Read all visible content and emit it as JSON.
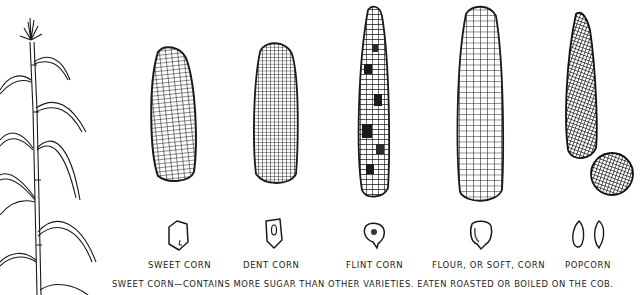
{
  "figure": {
    "stalk": {
      "name": "corn-stalk"
    },
    "varieties": [
      {
        "id": "sweet",
        "label": "Sweet Corn",
        "ear_style": "rows-spiral",
        "kernel": "flat-seed"
      },
      {
        "id": "dent",
        "label": "Dent Corn",
        "ear_style": "dense-grid",
        "kernel": "dented-seed"
      },
      {
        "id": "flint",
        "label": "Flint Corn",
        "ear_style": "mottled",
        "kernel": "round-seed"
      },
      {
        "id": "flour",
        "label": "Flour, or Soft, Corn",
        "ear_style": "large-kernels",
        "kernel": "soft-seed"
      },
      {
        "id": "popcorn",
        "label": "Popcorn",
        "ear_style": "small-pointed",
        "kernel": "pointed-seeds"
      }
    ],
    "caption": "Sweet corn—contains more sugar than other varieties. Eaten roasted or boiled on the cob."
  },
  "colors": {
    "ink": "#1a1a1a",
    "paper": "#ffffff"
  }
}
